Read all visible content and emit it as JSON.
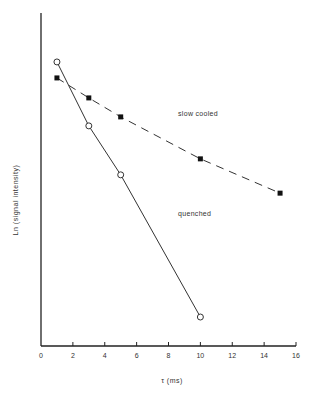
{
  "chart_data": {
    "type": "line",
    "title": "",
    "xlabel": "τ (ms)",
    "ylabel": "Ln (signal intensity)",
    "xlim": [
      0,
      16
    ],
    "ylim": [
      0,
      10
    ],
    "x_ticks": [
      0,
      2,
      4,
      6,
      8,
      10,
      12,
      14,
      16
    ],
    "y_ticks": [],
    "grid": false,
    "legend": null,
    "y_units_note": "y axis unlabeled; values on arbitrary 0-10 scale estimated from position",
    "series": [
      {
        "name": "slow cooled",
        "marker": "filled-square",
        "line_style": "dashed",
        "color": "#111111",
        "points": [
          {
            "x": 1,
            "y": 8.05
          },
          {
            "x": 3,
            "y": 7.45
          },
          {
            "x": 5,
            "y": 6.88
          },
          {
            "x": 10,
            "y": 5.62
          },
          {
            "x": 15,
            "y": 4.59
          }
        ]
      },
      {
        "name": "quenched",
        "marker": "open-circle",
        "line_style": "solid",
        "color": "#111111",
        "points": [
          {
            "x": 1,
            "y": 8.53
          },
          {
            "x": 3,
            "y": 6.61
          },
          {
            "x": 5,
            "y": 5.14
          },
          {
            "x": 10,
            "y": 0.87
          }
        ]
      }
    ],
    "annotations": [
      {
        "text": "slow cooled",
        "x": 8.6,
        "y": 6.9
      },
      {
        "text": "quenched",
        "x": 8.6,
        "y": 3.9
      }
    ]
  }
}
